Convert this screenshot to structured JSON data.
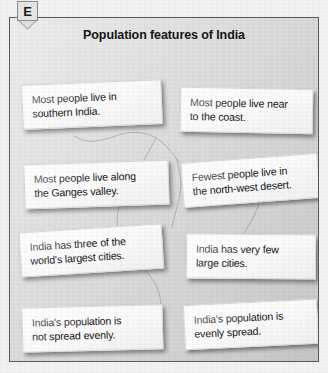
{
  "worksheet": {
    "tab_label": "E",
    "title": "Population features of India",
    "cards": [
      {
        "text": "Most people live in\nsouthern India."
      },
      {
        "text": "Most people live near\nto the coast."
      },
      {
        "text": "Most people live along\nthe Ganges valley."
      },
      {
        "text": "Fewest people live in\nthe north-west desert."
      },
      {
        "text": "India has three of the\nworld's largest cities."
      },
      {
        "text": "India has very few\nlarge cities."
      },
      {
        "text": "India's population is\nnot spread evenly."
      },
      {
        "text": "India's population is\nevenly spread."
      }
    ],
    "colors": {
      "page_background": "#ffffff",
      "panel_background": "#dcdcdc",
      "panel_border": "#5a5a5a",
      "card_background": "#fbfbfb",
      "text": "#131313",
      "map_outline": "#9a9a9a"
    }
  }
}
